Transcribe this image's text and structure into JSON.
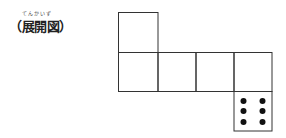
{
  "label": {
    "ruby": "てんかいず",
    "text": "（展開図）"
  },
  "net": {
    "description": "Cube net (development diagram) of a die",
    "line_color": "#333333",
    "dot_color": "#111111",
    "squares": [
      {
        "col": 0,
        "row": 0,
        "face": ""
      },
      {
        "col": 0,
        "row": 1,
        "face": ""
      },
      {
        "col": 1,
        "row": 1,
        "face": ""
      },
      {
        "col": 2,
        "row": 1,
        "face": ""
      },
      {
        "col": 3,
        "row": 1,
        "face": ""
      },
      {
        "col": 3,
        "row": 2,
        "face": "6"
      }
    ],
    "dice_face_value": 6
  }
}
